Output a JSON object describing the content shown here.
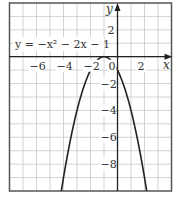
{
  "chart_data": {
    "type": "line",
    "title": "",
    "equation": "y = −x² − 2x − 1",
    "xlabel": "x",
    "ylabel": "y",
    "xlim": [
      -8,
      4
    ],
    "ylim": [
      -10,
      4
    ],
    "grid": true,
    "x_ticks": [
      {
        "value": -6,
        "label": "−6"
      },
      {
        "value": -4,
        "label": "−4"
      },
      {
        "value": -2,
        "label": "−2"
      },
      {
        "value": 0,
        "label": "0"
      },
      {
        "value": 2,
        "label": "2"
      }
    ],
    "y_ticks": [
      {
        "value": 2,
        "label": "2"
      },
      {
        "value": -2,
        "label": "−2"
      },
      {
        "value": -4,
        "label": "−4"
      },
      {
        "value": -6,
        "label": "−6"
      },
      {
        "value": -8,
        "label": "−8"
      }
    ],
    "series": [
      {
        "name": "y = −x² − 2x − 1",
        "x": [
          -4.16,
          -4,
          -3,
          -2,
          -1,
          0,
          1,
          2,
          2.16
        ],
        "y": [
          -10,
          -9,
          -4,
          -1,
          0,
          -1,
          -4,
          -9,
          -10
        ]
      }
    ],
    "colors": {
      "grid": "#c8c8c8",
      "border": "#555555",
      "axis": "#222222",
      "curve": "#222222"
    }
  }
}
